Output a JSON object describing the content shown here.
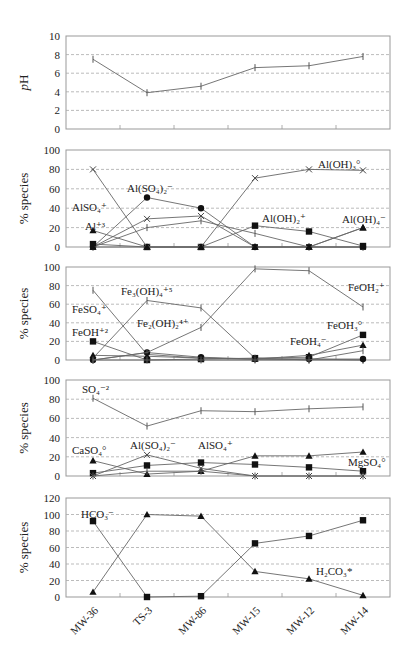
{
  "chart_data": {
    "type": "line",
    "categories": [
      "MW-36",
      "TS-3",
      "MW-86",
      "MW-15",
      "MW-12",
      "MW-14"
    ],
    "panels": [
      {
        "id": "ph",
        "ylabel": "pH",
        "ylim": [
          0,
          10
        ],
        "yticks": [
          0,
          2,
          4,
          6,
          8,
          10
        ],
        "grid": true,
        "series": [
          {
            "name": "pH",
            "marker": "plus",
            "values": [
              7.5,
              3.9,
              4.6,
              6.6,
              6.8,
              7.8
            ]
          }
        ],
        "labels": []
      },
      {
        "id": "aluminum",
        "ylabel": "% species",
        "ylim": [
          0,
          100
        ],
        "yticks": [
          0,
          20,
          40,
          60,
          80,
          100
        ],
        "grid": true,
        "series": [
          {
            "name": "Al+3",
            "marker": "triangle",
            "values": [
              17,
              0,
              0,
              0,
              0,
              20
            ]
          },
          {
            "name": "AlSO4+",
            "marker": "x",
            "values": [
              0,
              29,
              32,
              0,
              0,
              0
            ]
          },
          {
            "name": "Al(SO4)2-",
            "marker": "circle",
            "values": [
              0,
              51,
              40,
              0,
              0,
              0
            ]
          },
          {
            "name": "AlSO4+ (plus)",
            "marker": "plus",
            "values": [
              0,
              20,
              27,
              14,
              0,
              0
            ]
          },
          {
            "name": "Al(OH)2+",
            "marker": "square",
            "values": [
              3,
              0,
              0,
              22,
              16,
              1
            ]
          },
          {
            "name": "Al(OH)3o",
            "marker": "x",
            "values": [
              80,
              0,
              0,
              71,
              80,
              79
            ]
          },
          {
            "name": "Al(OH)4-",
            "marker": "triangle",
            "values": [
              0,
              0,
              0,
              0,
              0,
              20
            ]
          }
        ],
        "labels": [
          {
            "text": "Al(SO₄)₂⁻",
            "x": 127,
            "y": 192
          },
          {
            "text": "AlSO₄⁺",
            "x": 72,
            "y": 211
          },
          {
            "text": "Al⁺³",
            "x": 85,
            "y": 230
          },
          {
            "text": "Al(OH)₃°",
            "x": 318,
            "y": 168
          },
          {
            "text": "Al(OH)₂⁺",
            "x": 262,
            "y": 222
          },
          {
            "text": "Al(OH)₄⁻",
            "x": 342,
            "y": 223
          }
        ]
      },
      {
        "id": "iron",
        "ylabel": "% species",
        "ylim": [
          0,
          100
        ],
        "yticks": [
          0,
          20,
          40,
          60,
          80,
          100
        ],
        "grid": true,
        "series": [
          {
            "name": "FeOH+2",
            "marker": "square",
            "values": [
              20,
              0,
              1,
              2,
              3,
              27
            ]
          },
          {
            "name": "FeSO4+",
            "marker": "plus",
            "values": [
              75,
              6,
              2,
              1,
              1,
              0
            ]
          },
          {
            "name": "Fe3(OH)4+5",
            "marker": "plus",
            "values": [
              2,
              64,
              56,
              2,
              0,
              0
            ]
          },
          {
            "name": "Fe2(OH)2+4",
            "marker": "circle",
            "values": [
              0,
              8,
              3,
              1,
              1,
              1
            ]
          },
          {
            "name": "FeOH2+",
            "marker": "plus",
            "values": [
              0,
              8,
              35,
              98,
              96,
              57
            ]
          },
          {
            "name": "FeOH3o",
            "marker": "triangle",
            "values": [
              5,
              4,
              2,
              1,
              5,
              16
            ]
          },
          {
            "name": "FeOH4-",
            "marker": "plus",
            "values": [
              0,
              0,
              0,
              0,
              0,
              10
            ]
          }
        ],
        "labels": [
          {
            "text": "Fe₃(OH)₄⁺⁵",
            "x": 121,
            "y": 295
          },
          {
            "text": "FeSO₄⁺",
            "x": 72,
            "y": 313
          },
          {
            "text": "Fe₂(OH)₂⁴⁺",
            "x": 137,
            "y": 327
          },
          {
            "text": "FeOH⁺²",
            "x": 72,
            "y": 336
          },
          {
            "text": "FeOH₂⁺",
            "x": 348,
            "y": 291
          },
          {
            "text": "FeOH₃°",
            "x": 327,
            "y": 329
          },
          {
            "text": "FeOH₄⁻",
            "x": 290,
            "y": 345
          }
        ]
      },
      {
        "id": "sulfate",
        "ylabel": "% species",
        "ylim": [
          0,
          100
        ],
        "yticks": [
          0,
          20,
          40,
          60,
          80,
          100
        ],
        "grid": true,
        "series": [
          {
            "name": "SO4-2",
            "marker": "plus",
            "values": [
              81,
              52,
              68,
              67,
              70,
              72
            ]
          },
          {
            "name": "CaSO4o",
            "marker": "triangle",
            "values": [
              16,
              2,
              5,
              21,
              21,
              25
            ]
          },
          {
            "name": "MgSO4o",
            "marker": "square",
            "values": [
              3,
              11,
              14,
              12,
              9,
              5
            ]
          },
          {
            "name": "Al(SO4)2-",
            "marker": "x",
            "values": [
              0,
              22,
              8,
              0,
              0,
              0
            ]
          },
          {
            "name": "AlSO4+",
            "marker": "plus",
            "values": [
              0,
              5,
              5,
              0,
              0,
              0
            ]
          }
        ],
        "labels": [
          {
            "text": "SO₄⁻²",
            "x": 82,
            "y": 393
          },
          {
            "text": "CaSO₄°",
            "x": 72,
            "y": 454
          },
          {
            "text": "Al(SO₄)₂⁻",
            "x": 130,
            "y": 449
          },
          {
            "text": "AlSO₄⁺",
            "x": 198,
            "y": 449
          },
          {
            "text": "MgSO₄°",
            "x": 348,
            "y": 466
          }
        ]
      },
      {
        "id": "carbonate",
        "ylabel": "% species",
        "ylim": [
          0,
          120
        ],
        "yticks": [
          0,
          20,
          40,
          60,
          80,
          100,
          120
        ],
        "grid": true,
        "series": [
          {
            "name": "HCO3-",
            "marker": "square",
            "values": [
              92,
              0,
              1,
              65,
              74,
              93
            ]
          },
          {
            "name": "H2CO3*",
            "marker": "triangle",
            "values": [
              6,
              100,
              98,
              31,
              22,
              2
            ]
          }
        ],
        "labels": [
          {
            "text": "HCO₃⁻",
            "x": 81,
            "y": 518
          },
          {
            "text": "H₂CO₃*",
            "x": 316,
            "y": 575
          }
        ]
      }
    ]
  },
  "panels_layout_note": "5 stacked panels sharing x categories"
}
